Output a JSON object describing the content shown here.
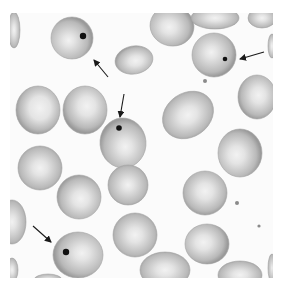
{
  "image": {
    "title": "Blood smear with Howell-Jolly bodies",
    "width": 283,
    "height": 290,
    "background": "#ffffff",
    "field": {
      "x": 10,
      "y": 13,
      "width": 263,
      "height": 265,
      "color": "#fbfbfb"
    }
  },
  "colors": {
    "cell_edge": "#9a9a9a",
    "cell_mid": "#b9b9b9",
    "cell_center": "#f2f2f2",
    "inclusion": "#111111",
    "arrow": "#1a1a1a",
    "debris": "#8a8a8a"
  },
  "cells": [
    {
      "cx": 72,
      "cy": 38,
      "rx": 21,
      "ry": 21,
      "rot": 0,
      "pale": 0.45,
      "hx": -4,
      "hy": 3
    },
    {
      "cx": 134,
      "cy": 60,
      "rx": 19,
      "ry": 14,
      "rot": -10,
      "pale": 0.6,
      "hx": 2,
      "hy": 2
    },
    {
      "cx": 172,
      "cy": 26,
      "rx": 22,
      "ry": 20,
      "rot": 10,
      "pale": 0.55,
      "hx": -3,
      "hy": 2
    },
    {
      "cx": 215,
      "cy": 18,
      "rx": 24,
      "ry": 11,
      "rot": 0,
      "pale": 0.5,
      "hx": 0,
      "hy": 0
    },
    {
      "cx": 262,
      "cy": 18,
      "rx": 14,
      "ry": 10,
      "rot": 0,
      "pale": 0.5,
      "hx": 0,
      "hy": 0
    },
    {
      "cx": 214,
      "cy": 55,
      "rx": 22,
      "ry": 22,
      "rot": 0,
      "pale": 0.45,
      "hx": -3,
      "hy": -3
    },
    {
      "cx": 14,
      "cy": 30,
      "rx": 6,
      "ry": 18,
      "rot": 0,
      "pale": 0.5,
      "hx": 0,
      "hy": 0
    },
    {
      "cx": 38,
      "cy": 110,
      "rx": 22,
      "ry": 24,
      "rot": 0,
      "pale": 0.8,
      "hx": 2,
      "hy": -2
    },
    {
      "cx": 85,
      "cy": 110,
      "rx": 22,
      "ry": 24,
      "rot": 0,
      "pale": 0.65,
      "hx": 2,
      "hy": -4
    },
    {
      "cx": 123,
      "cy": 143,
      "rx": 23,
      "ry": 25,
      "rot": -5,
      "pale": 0.5,
      "hx": 2,
      "hy": 4
    },
    {
      "cx": 128,
      "cy": 185,
      "rx": 20,
      "ry": 20,
      "rot": 0,
      "pale": 0.45,
      "hx": 0,
      "hy": 0
    },
    {
      "cx": 188,
      "cy": 115,
      "rx": 27,
      "ry": 22,
      "rot": -35,
      "pale": 0.6,
      "hx": 0,
      "hy": 0
    },
    {
      "cx": 257,
      "cy": 97,
      "rx": 19,
      "ry": 22,
      "rot": 0,
      "pale": 0.6,
      "hx": 2,
      "hy": -2
    },
    {
      "cx": 240,
      "cy": 153,
      "rx": 22,
      "ry": 24,
      "rot": 0,
      "pale": 0.6,
      "hx": -4,
      "hy": 2
    },
    {
      "cx": 40,
      "cy": 168,
      "rx": 22,
      "ry": 22,
      "rot": 0,
      "pale": 0.55,
      "hx": 0,
      "hy": 0
    },
    {
      "cx": 79,
      "cy": 197,
      "rx": 22,
      "ry": 22,
      "rot": 0,
      "pale": 0.6,
      "hx": 2,
      "hy": 2
    },
    {
      "cx": 12,
      "cy": 222,
      "rx": 14,
      "ry": 22,
      "rot": 0,
      "pale": 0.5,
      "hx": 0,
      "hy": 0
    },
    {
      "cx": 78,
      "cy": 255,
      "rx": 25,
      "ry": 23,
      "rot": 0,
      "pale": 0.5,
      "hx": 4,
      "hy": -2
    },
    {
      "cx": 135,
      "cy": 235,
      "rx": 22,
      "ry": 22,
      "rot": 0,
      "pale": 0.55,
      "hx": 0,
      "hy": 0
    },
    {
      "cx": 205,
      "cy": 193,
      "rx": 22,
      "ry": 22,
      "rot": 0,
      "pale": 0.6,
      "hx": 0,
      "hy": -2
    },
    {
      "cx": 207,
      "cy": 244,
      "rx": 22,
      "ry": 20,
      "rot": 0,
      "pale": 0.6,
      "hx": -4,
      "hy": -2
    },
    {
      "cx": 165,
      "cy": 270,
      "rx": 25,
      "ry": 18,
      "rot": 0,
      "pale": 0.55,
      "hx": 0,
      "hy": 0
    },
    {
      "cx": 240,
      "cy": 275,
      "rx": 22,
      "ry": 14,
      "rot": 0,
      "pale": 0.55,
      "hx": 0,
      "hy": 0
    },
    {
      "cx": 48,
      "cy": 280,
      "rx": 14,
      "ry": 6,
      "rot": 0,
      "pale": 0.5,
      "hx": 0,
      "hy": 0
    },
    {
      "cx": 272,
      "cy": 268,
      "rx": 4,
      "ry": 14,
      "rot": 0,
      "pale": 0.3,
      "hx": 0,
      "hy": 0
    },
    {
      "cx": 12,
      "cy": 270,
      "rx": 6,
      "ry": 12,
      "rot": 0,
      "pale": 0.5,
      "hx": 0,
      "hy": 0
    },
    {
      "cx": 272,
      "cy": 46,
      "rx": 4,
      "ry": 12,
      "rot": 0,
      "pale": 0.5,
      "hx": 0,
      "hy": 0
    }
  ],
  "inclusions": [
    {
      "cx": 83,
      "cy": 36,
      "r": 3.2
    },
    {
      "cx": 225,
      "cy": 59,
      "r": 2.3
    },
    {
      "cx": 119,
      "cy": 128,
      "r": 2.8
    },
    {
      "cx": 66,
      "cy": 252,
      "r": 3.2
    }
  ],
  "debris": [
    {
      "cx": 205,
      "cy": 81,
      "r": 2
    },
    {
      "cx": 237,
      "cy": 203,
      "r": 2
    },
    {
      "cx": 259,
      "cy": 226,
      "r": 1.6
    }
  ],
  "arrows": [
    {
      "x1": 108,
      "y1": 77,
      "x2": 94,
      "y2": 60,
      "label": "arrow pointing to inclusion in upper-left cell"
    },
    {
      "x1": 264,
      "y1": 52,
      "x2": 240,
      "y2": 59,
      "label": "arrow pointing to inclusion in upper-right cell"
    },
    {
      "x1": 124,
      "y1": 94,
      "x2": 120,
      "y2": 117,
      "label": "arrow pointing to inclusion in center cell"
    },
    {
      "x1": 33,
      "y1": 226,
      "x2": 51,
      "y2": 242,
      "label": "arrow pointing to inclusion in lower-left cell"
    }
  ]
}
